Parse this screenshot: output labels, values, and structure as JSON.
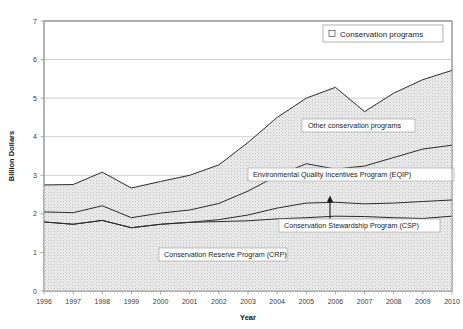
{
  "chart_data": {
    "type": "area",
    "title": "",
    "xlabel": "Year",
    "ylabel": "Billion Dollars",
    "stacked": true,
    "grid": true,
    "legend_position": "top-right",
    "legend_entries": [
      "Conservation programs"
    ],
    "xlim": [
      1996,
      2010
    ],
    "ylim": [
      0,
      7
    ],
    "ytick_labels": [
      "0",
      "1",
      "2",
      "3",
      "4",
      "5",
      "6",
      "7"
    ],
    "ytick_values": [
      0,
      1,
      2,
      3,
      4,
      5,
      6,
      7
    ],
    "categories": [
      1996,
      1997,
      1998,
      1999,
      2000,
      2001,
      2002,
      2003,
      2004,
      2005,
      2006,
      2007,
      2008,
      2009,
      2010
    ],
    "xtick_labels": [
      "1996",
      "1997",
      "1998",
      "1999",
      "2000",
      "2001",
      "2002",
      "2003",
      "2004",
      "2005",
      "2006",
      "2007",
      "2008",
      "2009",
      "2010"
    ],
    "series": [
      {
        "name": "Conservation Reserve Program (CRP)",
        "label": "Conservation Reserve Program (CRP)",
        "values": [
          1.79,
          1.73,
          1.83,
          1.64,
          1.73,
          1.78,
          1.8,
          1.82,
          1.87,
          1.9,
          1.94,
          1.93,
          1.9,
          1.88,
          1.94
        ]
      },
      {
        "name": "Conservation Stewardship Program (CSP)",
        "label": "Conservation Stewardship Program (CSP)",
        "values": [
          0.0,
          0.0,
          0.0,
          0.0,
          0.0,
          0.0,
          0.05,
          0.15,
          0.28,
          0.38,
          0.36,
          0.33,
          0.38,
          0.44,
          0.42
        ]
      },
      {
        "name": "Environmental Quality Incentives Program (EQIP)",
        "label": "Environmental Quality Incentives Program (EQIP)",
        "values": [
          0.26,
          0.3,
          0.38,
          0.26,
          0.29,
          0.32,
          0.42,
          0.62,
          0.84,
          1.02,
          0.86,
          0.98,
          1.18,
          1.36,
          1.42
        ]
      },
      {
        "name": "Other conservation programs",
        "label": "Other conservation programs",
        "values": [
          0.7,
          0.73,
          0.87,
          0.77,
          0.82,
          0.9,
          1.0,
          1.26,
          1.51,
          1.7,
          2.12,
          1.41,
          1.67,
          1.8,
          1.94
        ]
      }
    ],
    "stack_totals": [
      2.75,
      2.76,
      3.08,
      2.67,
      2.84,
      3.0,
      3.27,
      3.85,
      4.5,
      5.0,
      5.28,
      4.65,
      5.13,
      5.48,
      5.72
    ],
    "stack_cum_crp": [
      1.79,
      1.73,
      1.83,
      1.64,
      1.73,
      1.78,
      1.8,
      1.82,
      1.87,
      1.9,
      1.94,
      1.93,
      1.9,
      1.88,
      1.94
    ],
    "stack_cum_csp": [
      1.79,
      1.73,
      1.83,
      1.64,
      1.73,
      1.78,
      1.85,
      1.97,
      2.15,
      2.28,
      2.3,
      2.26,
      2.28,
      2.32,
      2.36
    ],
    "stack_cum_eqip": [
      2.05,
      2.03,
      2.21,
      1.9,
      2.02,
      2.1,
      2.27,
      2.59,
      2.99,
      3.3,
      3.16,
      3.24,
      3.46,
      3.68,
      3.78
    ],
    "annotations": [
      {
        "name": "other-conservation-programs-callout",
        "text": "Other conservation programs"
      },
      {
        "name": "eqip-callout",
        "text": "Environmental Quality Incentives Program (EQIP)"
      },
      {
        "name": "csp-callout",
        "text": "Conservation Stewardship Program (CSP)",
        "has_arrow": true
      },
      {
        "name": "crp-callout",
        "text": "Conservation Reserve Program (CRP)"
      }
    ],
    "colors": {
      "area_fill": "#e2e2e2",
      "line": "#2b2b2b",
      "grid": "#b9b9b9",
      "frame": "#8a8a8a",
      "background": "#ffffff",
      "text": "#1a1a1a"
    }
  },
  "legend": {
    "entry_label": "Conservation programs",
    "marker": "square-marker"
  },
  "axes": {
    "y_title": "Billion Dollars",
    "x_title": "Year"
  }
}
